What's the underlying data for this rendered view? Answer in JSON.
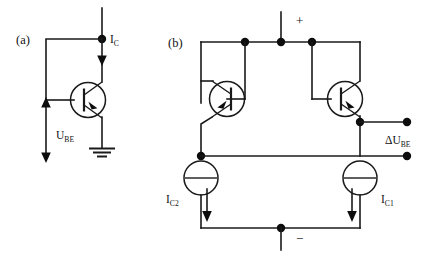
{
  "figure": {
    "background_color": "#ffffff",
    "line_color": "#1a1a1a",
    "text_color": "#111111"
  },
  "panels": [
    {
      "id": "a",
      "label": "(a)",
      "description": "Single PNP transistor with collector current and base-emitter voltage",
      "labels": {
        "collector_current": "I",
        "collector_current_sub": "C",
        "base_emitter_voltage": "U",
        "base_emitter_voltage_sub": "BE"
      },
      "components": [
        "transistor-a",
        "node-dot-collector",
        "ground-symbol",
        "current-arrow-ic",
        "voltage-arrow-ube"
      ]
    },
    {
      "id": "b",
      "label": "(b)",
      "description": "Differential transistor pair with two current sources and differential output voltage",
      "labels": {
        "supply_positive": "+",
        "supply_negative": "−",
        "delta_voltage": "ΔU",
        "delta_voltage_sub": "BE",
        "current_left": "I",
        "current_left_sub": "C2",
        "current_right": "I",
        "current_right_sub": "C1"
      },
      "components": [
        "transistor-b-left",
        "transistor-b-right",
        "current-source-left",
        "current-source-right",
        "output-terminal-top",
        "output-terminal-bottom",
        "supply-rail-top",
        "supply-rail-bottom"
      ]
    }
  ]
}
